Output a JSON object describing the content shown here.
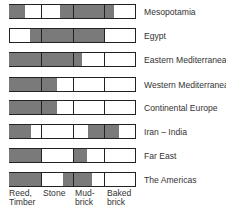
{
  "chart_data": {
    "type": "table",
    "title": "",
    "columns": [
      "Reed, Timber",
      "Stone",
      "Mud-brick",
      "Baked brick"
    ],
    "shade_color": "#7a7a7a",
    "rows": [
      {
        "label": "Mesopotamia",
        "shaded": [
          [
            0,
            0.5
          ],
          [
            1.6,
            3.3
          ]
        ]
      },
      {
        "label": "Egypt",
        "shaded": [
          [
            0.65,
            3.0
          ]
        ]
      },
      {
        "label": "Eastern Mediterranean",
        "shaded": [
          [
            0,
            2.3
          ]
        ]
      },
      {
        "label": "Western Mediterranean",
        "shaded": [
          [
            0,
            1.5
          ]
        ]
      },
      {
        "label": "Continental Europe",
        "shaded": [
          [
            0,
            1.5
          ]
        ]
      },
      {
        "label": "Iran – India",
        "shaded": [
          [
            0,
            0.7
          ],
          [
            2.5,
            3.45
          ]
        ]
      },
      {
        "label": "Far East",
        "shaded": [
          [
            0,
            1.0
          ],
          [
            2.0,
            2.45
          ]
        ]
      },
      {
        "label": "The Americas",
        "shaded": [
          [
            0,
            1.0
          ],
          [
            1.7,
            2.6
          ]
        ]
      }
    ]
  },
  "labels": {
    "rows": [
      "Mesopotamia",
      "Egypt",
      "Eastern Mediterranean",
      "Western Mediterranean",
      "Continental Europe",
      "Iran – India",
      "Far East",
      "The Americas"
    ],
    "columns": [
      {
        "line1": "Reed,",
        "line2": "Timber"
      },
      {
        "line1": "Stone",
        "line2": ""
      },
      {
        "line1": "Mud-",
        "line2": "brick"
      },
      {
        "line1": "Baked",
        "line2": "brick"
      }
    ]
  }
}
